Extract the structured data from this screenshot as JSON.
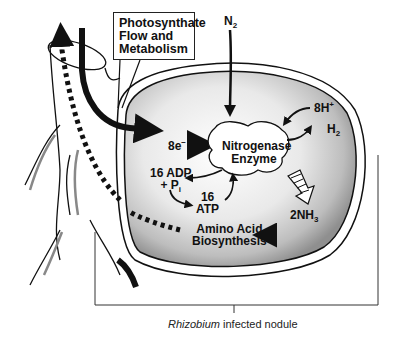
{
  "diagram": {
    "title_box": {
      "line1": "Photosynthate",
      "line2": "Flow and",
      "line3": "Metabolism"
    },
    "labels": {
      "n2": "N",
      "n2_sub": "2",
      "electrons": "8e",
      "electrons_sup": "−",
      "enzyme_line1": "Nitrogenase",
      "enzyme_line2": "Enzyme",
      "protons": "8H",
      "protons_sup": "+",
      "h2": "H",
      "h2_sub": "2",
      "adp_line1": "16 ADP",
      "adp_line2": "+ P",
      "adp_sub": "i",
      "atp_line1": "16",
      "atp_line2": "ATP",
      "nh3": "2NH",
      "nh3_sub": "3",
      "amino_line1": "Amino Acid",
      "amino_line2": "Biosynthesis"
    },
    "caption": {
      "italic": "Rhizobium",
      "rest": " infected nodule"
    },
    "colors": {
      "ink": "#111111",
      "nodule_fill_light": "#f2f2f2",
      "nodule_fill_dark": "#9a9a9a",
      "background": "#ffffff"
    }
  }
}
